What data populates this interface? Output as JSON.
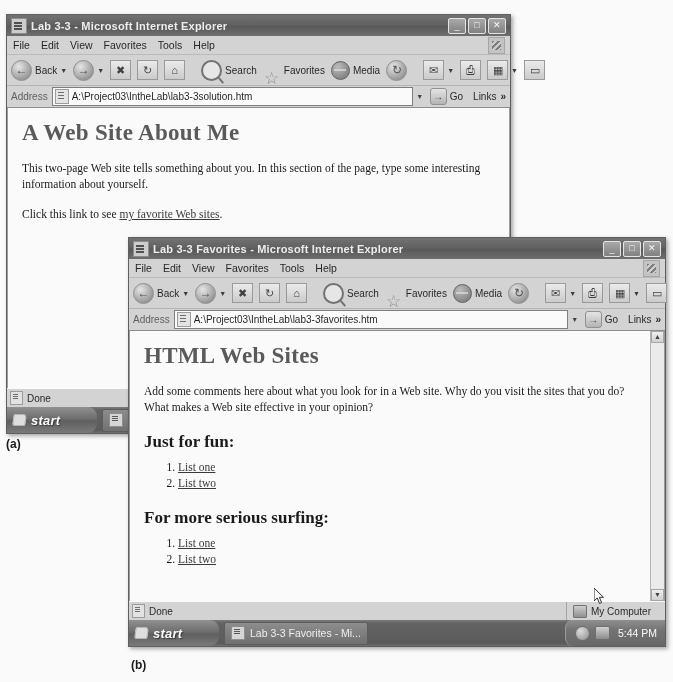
{
  "figure": {
    "label_a": "(a)",
    "label_b": "(b)"
  },
  "window_a": {
    "title": "Lab 3-3 - Microsoft Internet Explorer",
    "title_icon": "ie-page-icon",
    "controls": {
      "minimize": "_",
      "maximize": "□",
      "close": "✕"
    },
    "menu": [
      "File",
      "Edit",
      "View",
      "Favorites",
      "Tools",
      "Help"
    ],
    "toolbar": {
      "back": "Back",
      "forward": "",
      "stop": "✖",
      "refresh": "↻",
      "home": "⌂",
      "search": "Search",
      "favorites": "Favorites",
      "media": "Media",
      "history": "⌚",
      "mail": "✉",
      "print": "⎙",
      "edit": "▦",
      "discuss": "▭"
    },
    "address": {
      "label": "Address",
      "value": "A:\\Project03\\IntheLab\\lab3-3solution.htm",
      "go": "Go",
      "links": "Links",
      "chevron": "»"
    },
    "page": {
      "heading": "A Web Site About Me",
      "paragraph1": "This two-page Web site tells something about you. In this section of the page, type some interesting information about yourself.",
      "paragraph2_before": "Click this link to see ",
      "link_text": "my favorite Web sites",
      "paragraph2_after": "."
    },
    "status": {
      "text": "Done"
    },
    "taskbar": {
      "start": "start",
      "buttons": [
        "Lab 3-3 -"
      ]
    }
  },
  "window_b": {
    "title": "Lab 3-3 Favorites - Microsoft Internet Explorer",
    "title_icon": "ie-page-icon",
    "controls": {
      "minimize": "_",
      "maximize": "□",
      "close": "✕"
    },
    "menu": [
      "File",
      "Edit",
      "View",
      "Favorites",
      "Tools",
      "Help"
    ],
    "toolbar": {
      "back": "Back",
      "forward": "",
      "stop": "✖",
      "refresh": "↻",
      "home": "⌂",
      "search": "Search",
      "favorites": "Favorites",
      "media": "Media",
      "history": "⌚",
      "mail": "✉",
      "print": "⎙",
      "edit": "▦",
      "discuss": "▭"
    },
    "address": {
      "label": "Address",
      "value": "A:\\Project03\\IntheLab\\lab3-3favorites.htm",
      "go": "Go",
      "links": "Links",
      "chevron": "»"
    },
    "page": {
      "heading": "HTML Web Sites",
      "paragraph": "Add some comments here about what you look for in a Web site. Why do you visit the sites that you do? What makes a Web site effective in your opinion?",
      "section1_heading": "Just for fun:",
      "section1_items": [
        "List one",
        "List two"
      ],
      "section2_heading": "For more serious surfing:",
      "section2_items": [
        "List one",
        "List two"
      ]
    },
    "status": {
      "text": "Done",
      "zone": "My Computer"
    },
    "taskbar": {
      "start": "start",
      "buttons": [
        "Lab 3-3 Favorites - Mi..."
      ],
      "clock": "5:44 PM"
    }
  }
}
